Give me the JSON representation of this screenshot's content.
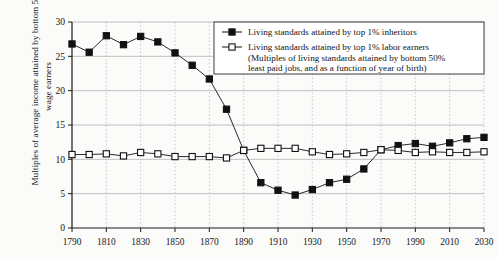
{
  "chart_data": {
    "type": "line",
    "title": "",
    "xlabel": "",
    "ylabel": "Multiples of average income attained by bottom 50% wage earners",
    "xlim": [
      1790,
      2030
    ],
    "ylim": [
      0,
      30
    ],
    "yticks": [
      0,
      5,
      10,
      15,
      20,
      25,
      30
    ],
    "xticks": [
      1790,
      1810,
      1830,
      1850,
      1870,
      1890,
      1910,
      1930,
      1950,
      1970,
      1990,
      2010,
      2030
    ],
    "grid": "horizontal solid gray, vertical dotted gray",
    "legend_position": "top-right inside plot",
    "x": [
      1790,
      1800,
      1810,
      1820,
      1830,
      1840,
      1850,
      1860,
      1870,
      1880,
      1890,
      1900,
      1910,
      1920,
      1930,
      1940,
      1950,
      1960,
      1970,
      1980,
      1990,
      2000,
      2010,
      2020,
      2030
    ],
    "series": [
      {
        "name": "Living standards attained by top 1% inheritors",
        "marker": "filled-square",
        "color": "#111111",
        "values": [
          26.8,
          25.6,
          28.0,
          26.7,
          27.9,
          27.1,
          25.5,
          23.7,
          21.7,
          17.3,
          11.3,
          6.6,
          5.5,
          4.8,
          5.6,
          6.6,
          7.1,
          8.6,
          11.4,
          12.0,
          12.3,
          11.9,
          12.4,
          13.0,
          13.2
        ]
      },
      {
        "name": "Living standards attained by top 1% labor earners",
        "marker": "open-square",
        "color": "#111111",
        "values": [
          10.7,
          10.7,
          10.8,
          10.5,
          11.0,
          10.8,
          10.4,
          10.4,
          10.4,
          10.2,
          11.3,
          11.6,
          11.6,
          11.6,
          11.1,
          10.7,
          10.8,
          11.0,
          11.4,
          11.3,
          11.0,
          11.1,
          11.0,
          11.0,
          11.1
        ]
      }
    ],
    "legend_entries": [
      {
        "label": "Living standards attained by top 1% inheritors",
        "marker": "filled-square"
      },
      {
        "label": "Living standards attained by top 1% labor earners",
        "marker": "open-square"
      },
      {
        "label": "(Multiples of living standards attained by bottom 50%",
        "marker": "none"
      },
      {
        "label": "least paid jobs, and as a function of year of birth)",
        "marker": "none"
      }
    ]
  }
}
